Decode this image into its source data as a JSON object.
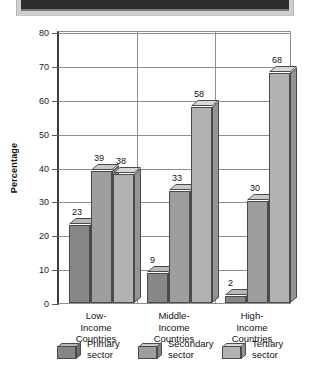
{
  "top_band": {
    "name": "cropped-image-strip"
  },
  "chart_data": {
    "type": "bar",
    "title": "",
    "subtitle": "",
    "xlabel": "",
    "ylabel": "Percentage",
    "ylim": [
      0,
      80
    ],
    "y_ticks": [
      0,
      10,
      20,
      30,
      40,
      50,
      60,
      70,
      80
    ],
    "grid": true,
    "legend_position": "bottom",
    "categories": [
      "Low-\nIncome\nCountries",
      "Middle-\nIncome\nCountries",
      "High-\nIncome\nCountries"
    ],
    "category_lines": [
      [
        "Low-",
        "Income",
        "Countries"
      ],
      [
        "Middle-",
        "Income",
        "Countries"
      ],
      [
        "High-",
        "Income",
        "Countries"
      ]
    ],
    "series": [
      {
        "name": "Primary sector",
        "key": "primary",
        "color": "#878787",
        "values": [
          23,
          9,
          2
        ]
      },
      {
        "name": "Secondary sector",
        "key": "secondary",
        "color": "#9e9e9e",
        "values": [
          39,
          33,
          30
        ]
      },
      {
        "name": "Tertiary sector",
        "key": "tertiary",
        "color": "#b2b2b2",
        "values": [
          38,
          58,
          68
        ]
      }
    ],
    "data_labels": [
      [
        23,
        39,
        38
      ],
      [
        9,
        33,
        58
      ],
      [
        2,
        30,
        68
      ]
    ]
  },
  "axis": {
    "y_tick_labels": [
      "80",
      "70",
      "60",
      "50",
      "40",
      "30",
      "20",
      "10",
      "0"
    ],
    "y_title": "Percentage"
  },
  "legend": {
    "items": [
      {
        "line1": "Primary",
        "line2": "sector"
      },
      {
        "line1": "Secondary",
        "line2": "sector"
      },
      {
        "line1": "Tertiary",
        "line2": "sector"
      }
    ]
  }
}
